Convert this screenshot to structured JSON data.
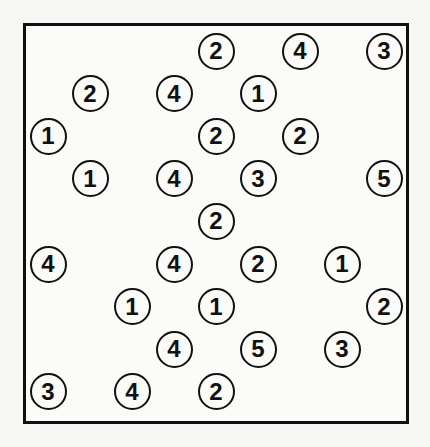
{
  "puzzle": {
    "type": "hashiwokakero",
    "grid_cols": 9,
    "grid_rows": 9,
    "islands": [
      {
        "row": 0,
        "col": 4,
        "value": "2"
      },
      {
        "row": 0,
        "col": 6,
        "value": "4"
      },
      {
        "row": 0,
        "col": 8,
        "value": "3"
      },
      {
        "row": 1,
        "col": 1,
        "value": "2"
      },
      {
        "row": 1,
        "col": 3,
        "value": "4"
      },
      {
        "row": 1,
        "col": 5,
        "value": "1"
      },
      {
        "row": 2,
        "col": 0,
        "value": "1"
      },
      {
        "row": 2,
        "col": 4,
        "value": "2"
      },
      {
        "row": 2,
        "col": 6,
        "value": "2"
      },
      {
        "row": 3,
        "col": 1,
        "value": "1"
      },
      {
        "row": 3,
        "col": 3,
        "value": "4"
      },
      {
        "row": 3,
        "col": 5,
        "value": "3"
      },
      {
        "row": 3,
        "col": 8,
        "value": "5"
      },
      {
        "row": 4,
        "col": 4,
        "value": "2"
      },
      {
        "row": 5,
        "col": 0,
        "value": "4"
      },
      {
        "row": 5,
        "col": 3,
        "value": "4"
      },
      {
        "row": 5,
        "col": 5,
        "value": "2"
      },
      {
        "row": 5,
        "col": 7,
        "value": "1"
      },
      {
        "row": 6,
        "col": 2,
        "value": "1"
      },
      {
        "row": 6,
        "col": 4,
        "value": "1"
      },
      {
        "row": 6,
        "col": 8,
        "value": "2"
      },
      {
        "row": 7,
        "col": 3,
        "value": "4"
      },
      {
        "row": 7,
        "col": 5,
        "value": "5"
      },
      {
        "row": 7,
        "col": 7,
        "value": "3"
      },
      {
        "row": 8,
        "col": 0,
        "value": "3"
      },
      {
        "row": 8,
        "col": 2,
        "value": "4"
      },
      {
        "row": 8,
        "col": 4,
        "value": "2"
      }
    ]
  }
}
